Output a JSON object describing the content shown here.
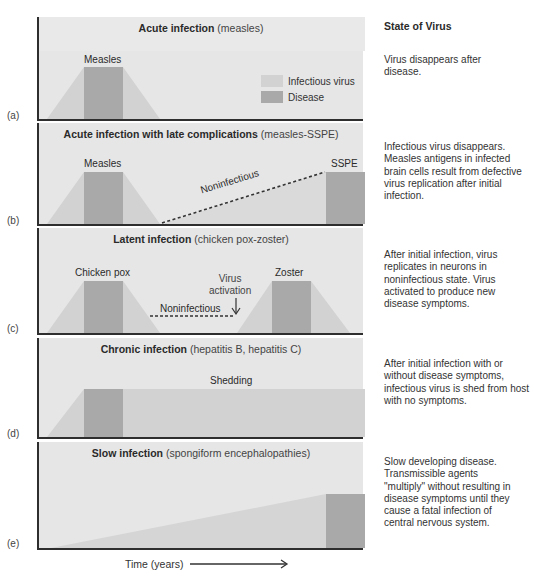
{
  "colors": {
    "background": "#e6e6e6",
    "infectious_virus": "#d2d2d2",
    "disease": "#a9a9a9",
    "axis": "#2e2e2e",
    "text": "#2a2a2a"
  },
  "legend": {
    "items": [
      {
        "label": "Infectious virus",
        "color": "#d2d2d2"
      },
      {
        "label": "Disease",
        "color": "#a9a9a9"
      }
    ]
  },
  "state_header": "State of Virus",
  "panels": [
    {
      "letter": "(a)",
      "title_bold": "Acute infection",
      "title_sub": "(measles)",
      "labels": {
        "disease1": "Measles"
      },
      "state": "Virus disappears after disease."
    },
    {
      "letter": "(b)",
      "title_bold": "Acute infection with late complications",
      "title_sub": "(measles-SSPE)",
      "labels": {
        "disease1": "Measles",
        "disease2": "SSPE",
        "dashed": "Noninfectious"
      },
      "state": "Infectious virus disappears. Measles antigens in infected brain cells result from defective virus replication after initial infection."
    },
    {
      "letter": "(c)",
      "title_bold": "Latent infection",
      "title_sub": "(chicken pox-zoster)",
      "labels": {
        "disease1": "Chicken pox",
        "disease2": "Zoster",
        "dashed": "Noninfectious",
        "activation_line1": "Virus",
        "activation_line2": "activation"
      },
      "state": "After initial infection, virus replicates in neurons in noninfectious state.  Virus activated to produce new disease symptoms."
    },
    {
      "letter": "(d)",
      "title_bold": "Chronic infection",
      "title_sub": "(hepatitis B, hepatitis C)",
      "labels": {
        "shedding": "Shedding"
      },
      "state": "After initial infection with or without disease symptoms, infectious virus is shed from host with no symptoms."
    },
    {
      "letter": "(e)",
      "title_bold": "Slow infection",
      "title_sub": "(spongiform encephalopathies)",
      "labels": {},
      "state": "Slow developing disease. Transmissible agents \"multiply\" without resulting in disease symptoms until they cause a fatal infection of central nervous system."
    }
  ],
  "x_axis": {
    "label": "Time (years)",
    "arrow_icon": "right-arrow"
  }
}
